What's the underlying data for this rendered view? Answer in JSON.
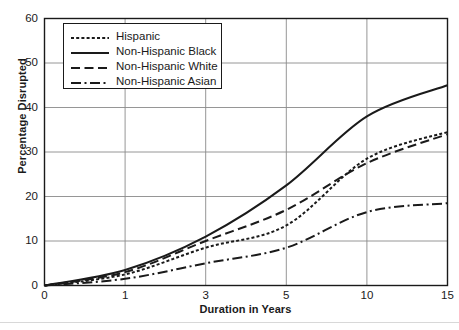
{
  "chart_data": {
    "type": "line",
    "title": "",
    "xlabel": "Duration in Years",
    "ylabel": "Percentage Disrupted",
    "x": [
      0,
      1,
      3,
      5,
      10,
      15
    ],
    "xtick_labels": [
      "0",
      "1",
      "3",
      "5",
      "10",
      "15"
    ],
    "x_axis_scale": "categorical-even-spacing",
    "ytick_labels": [
      "0",
      "10",
      "20",
      "30",
      "40",
      "50",
      "60"
    ],
    "yticks": [
      0,
      10,
      20,
      30,
      40,
      50,
      60
    ],
    "ylim": [
      0,
      60
    ],
    "grid": "both",
    "legend_position": "top-left-inside",
    "series": [
      {
        "name": "Hispanic",
        "line_style": "dotted",
        "color": "#1a1a1a",
        "values": [
          0,
          2.5,
          8.5,
          13.5,
          28.5,
          34.5
        ]
      },
      {
        "name": "Non-Hispanic Black",
        "line_style": "solid",
        "color": "#1a1a1a",
        "values": [
          0,
          3.5,
          11.0,
          22.5,
          38.0,
          45.0
        ]
      },
      {
        "name": "Non-Hispanic White",
        "line_style": "dashed",
        "color": "#1a1a1a",
        "values": [
          0,
          3.0,
          10.0,
          17.0,
          27.5,
          34.0
        ]
      },
      {
        "name": "Non-Hispanic Asian",
        "line_style": "dash-dot",
        "color": "#1a1a1a",
        "values": [
          0,
          1.5,
          5.0,
          8.5,
          16.5,
          18.5
        ]
      }
    ]
  }
}
